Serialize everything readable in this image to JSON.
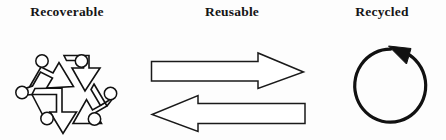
{
  "figure": {
    "background_color": "#fdfdfd",
    "ink_color": "#111111",
    "panels": [
      {
        "id": "recoverable",
        "label": "Recoverable",
        "icon_name": "recycling-triangle-symbol",
        "icon_description": "Three chasing arrows forming a triangle with six small circles at the corners"
      },
      {
        "id": "reusable",
        "label": "Reusable",
        "icon_name": "bidirectional-arrows",
        "icon_description": "A hollow outlined arrow pointing right above a hollow outlined arrow pointing left",
        "arrows": [
          {
            "name": "arrow-right",
            "direction": "right"
          },
          {
            "name": "arrow-left",
            "direction": "left"
          }
        ]
      },
      {
        "id": "recycled",
        "label": "Recycled",
        "icon_name": "circular-arrow-loop",
        "icon_description": "An open circle with a solid arrowhead at the top right pointing counterclockwise",
        "direction": "counterclockwise"
      }
    ]
  }
}
